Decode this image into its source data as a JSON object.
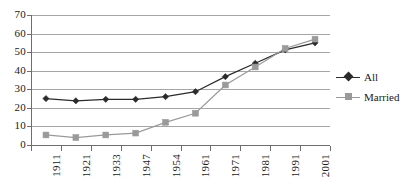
{
  "chart_data": {
    "type": "line",
    "title": "",
    "xlabel": "",
    "ylabel": "",
    "categories": [
      "1911",
      "1921",
      "1933",
      "1947",
      "1954",
      "1961",
      "1971",
      "1981",
      "1991",
      "2001"
    ],
    "series": [
      {
        "name": "All",
        "marker": "diamond",
        "color": "#2b2b2b",
        "values": [
          25,
          23.8,
          24.6,
          24.6,
          26,
          28.7,
          36.8,
          44,
          51.2,
          55
        ]
      },
      {
        "name": "Married",
        "marker": "square",
        "color": "#9a9a9a",
        "values": [
          5.4,
          4,
          5.4,
          6.4,
          12.2,
          17.1,
          32.3,
          42,
          52,
          57
        ]
      }
    ],
    "ylim": [
      0,
      70
    ],
    "yticks": [
      0,
      10,
      20,
      30,
      40,
      50,
      60,
      70
    ],
    "ytick_labels": [
      "0",
      "10",
      "20",
      "30",
      "40",
      "50",
      "60",
      "70"
    ],
    "grid": "horizontal",
    "legend_position": "right"
  },
  "legend": {
    "entries": [
      {
        "label": "All"
      },
      {
        "label": "Married"
      }
    ]
  },
  "colors": {
    "series_all": "#2b2b2b",
    "series_married": "#9a9a9a",
    "gridline": "#a6a6a6",
    "axis": "#6e6e6e",
    "background": "#ffffff"
  }
}
